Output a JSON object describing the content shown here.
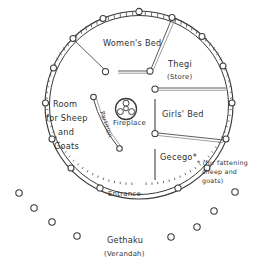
{
  "diagram": {
    "labels": {
      "womens_bed": "Women's Bed",
      "thegi": "Thegi",
      "thegi_sub": "(Store)",
      "girls_bed": "Girls' Bed",
      "gecego": "Gecego*",
      "room_line1": "Room",
      "room_line2": "for Sheep",
      "room_line3": "and",
      "room_line4": "Goats",
      "fireplace": "Fireplace",
      "partition": "Partition",
      "entrance": "Entrance",
      "gethaku": "Gethaku",
      "gethaku_sub": "(Verandah)",
      "footnote_line1": "* (for fattening",
      "footnote_line2": "sheep and",
      "footnote_line3": "goats)"
    },
    "colors": {
      "ink": "#2f2f2f",
      "wall": "#3a3a3a",
      "beam": "#4a4a4a",
      "screen": "#7c7c7c",
      "paper": "#ffffff"
    },
    "wall": {
      "center_x": 139,
      "center_y": 105,
      "radius_outer": 94,
      "radius_inner": 90
    },
    "wall_posts": [
      {
        "x": 139,
        "y": 11
      },
      {
        "x": 103,
        "y": 18
      },
      {
        "x": 73,
        "y": 38
      },
      {
        "x": 53,
        "y": 68
      },
      {
        "x": 45,
        "y": 103
      },
      {
        "x": 52,
        "y": 139
      },
      {
        "x": 71,
        "y": 168
      },
      {
        "x": 100,
        "y": 190
      },
      {
        "x": 172,
        "y": 17
      },
      {
        "x": 202,
        "y": 36
      },
      {
        "x": 224,
        "y": 66
      },
      {
        "x": 232,
        "y": 103
      },
      {
        "x": 226,
        "y": 139
      },
      {
        "x": 207,
        "y": 168
      },
      {
        "x": 178,
        "y": 190
      }
    ],
    "interior_posts": [
      {
        "x": 105,
        "y": 71,
        "name": "womens-bed-post"
      },
      {
        "x": 150,
        "y": 71,
        "name": "thegi-post"
      },
      {
        "x": 155,
        "y": 89,
        "name": "thegi-lower-post"
      },
      {
        "x": 155,
        "y": 134,
        "name": "girls-bed-post"
      },
      {
        "x": 93,
        "y": 98,
        "name": "partition-top-post"
      },
      {
        "x": 119,
        "y": 148,
        "name": "partition-bottom-post"
      }
    ],
    "verandah_posts": [
      {
        "x": 19,
        "y": 193
      },
      {
        "x": 34,
        "y": 208
      },
      {
        "x": 52,
        "y": 222
      },
      {
        "x": 77,
        "y": 236
      },
      {
        "x": 170,
        "y": 237
      },
      {
        "x": 197,
        "y": 227
      },
      {
        "x": 214,
        "y": 212
      },
      {
        "x": 235,
        "y": 192
      }
    ],
    "fireplace": {
      "x": 126,
      "y": 109,
      "radius": 10.5,
      "stone_radius": 3.1,
      "stones": [
        {
          "x": 126,
          "y": 103
        },
        {
          "x": 120.5,
          "y": 112
        },
        {
          "x": 131.5,
          "y": 112
        },
        {
          "x": 126,
          "y": 109
        }
      ]
    }
  }
}
